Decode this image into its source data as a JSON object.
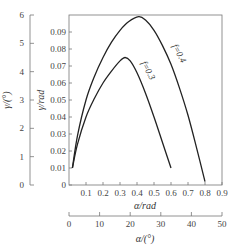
{
  "chart_data": {
    "type": "line",
    "title": "",
    "xlabel": "α/rad",
    "ylabel": "γ/rad",
    "secondary_xlabel": "α/(°)",
    "secondary_ylabel": "γ/(°)",
    "xlim": [
      0,
      0.9
    ],
    "ylim": [
      0,
      0.1
    ],
    "secondary_xlim": [
      0,
      50
    ],
    "secondary_ylim": [
      0,
      6
    ],
    "x_ticks": [
      0.1,
      0.2,
      0.3,
      0.4,
      0.5,
      0.6,
      0.7,
      0.8,
      0.9
    ],
    "x_tick_labels": [
      "0.1",
      "0.2",
      "0.3",
      "0.4",
      "0.5",
      "0.6",
      "0.7",
      "0.8",
      "0.9"
    ],
    "y_ticks": [
      0,
      0.01,
      0.02,
      0.03,
      0.04,
      0.05,
      0.06,
      0.07,
      0.08,
      0.09
    ],
    "y_tick_labels": [
      "0",
      "0.01",
      "0.02",
      "0.03",
      "0.04",
      "0.05",
      "0.06",
      "0.07",
      "0.08",
      "0.09"
    ],
    "secondary_x_ticks": [
      0,
      10,
      20,
      30,
      40,
      50
    ],
    "secondary_x_tick_labels": [
      "0",
      "10",
      "20",
      "30",
      "40",
      "50"
    ],
    "secondary_y_ticks": [
      0,
      1,
      2,
      3,
      4,
      5,
      6
    ],
    "secondary_y_tick_labels": [
      "0",
      "1",
      "2",
      "3",
      "4",
      "5",
      "6"
    ],
    "x_origin_label": "0",
    "grid": false,
    "legend": "inline curve labels",
    "series": [
      {
        "name": "f=0.4",
        "label": "f=0.4",
        "x": [
          0.02,
          0.05,
          0.1,
          0.15,
          0.2,
          0.25,
          0.3,
          0.35,
          0.41,
          0.45,
          0.5,
          0.55,
          0.6,
          0.65,
          0.7,
          0.75,
          0.8
        ],
        "y": [
          0.01,
          0.029,
          0.05,
          0.064,
          0.075,
          0.084,
          0.091,
          0.096,
          0.099,
          0.097,
          0.091,
          0.082,
          0.071,
          0.057,
          0.041,
          0.022,
          0.002
        ]
      },
      {
        "name": "f=0.3",
        "label": "f=0.3",
        "x": [
          0.02,
          0.05,
          0.1,
          0.15,
          0.2,
          0.25,
          0.3,
          0.33,
          0.36,
          0.4,
          0.45,
          0.5,
          0.55,
          0.6
        ],
        "y": [
          0.01,
          0.024,
          0.04,
          0.051,
          0.06,
          0.067,
          0.073,
          0.075,
          0.073,
          0.066,
          0.054,
          0.04,
          0.025,
          0.01
        ]
      }
    ]
  }
}
